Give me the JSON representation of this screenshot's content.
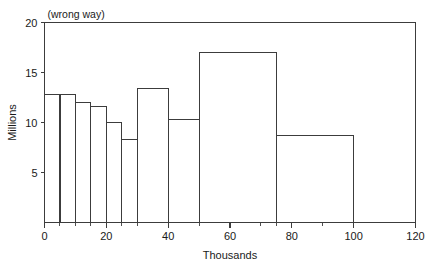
{
  "chart_data": {
    "type": "bar",
    "title": "",
    "annotation": "(wrong way)",
    "xlabel": "Thousands",
    "ylabel": "Millions",
    "xlim": [
      0,
      120
    ],
    "ylim": [
      0,
      20
    ],
    "grid": false,
    "legend": null,
    "x_ticks": [
      0,
      20,
      40,
      60,
      80,
      100,
      120
    ],
    "x_tick_labels": [
      "0",
      "20",
      "40",
      "60",
      "80",
      "100",
      "120"
    ],
    "x_minor_ticks": [
      5,
      10,
      15,
      25,
      30,
      50,
      70,
      75,
      90
    ],
    "y_ticks": [
      5,
      10,
      15,
      20
    ],
    "y_tick_labels": [
      "5",
      "10",
      "15",
      "20"
    ],
    "bins": [
      {
        "x0": 0,
        "x1": 5,
        "value": 12.8
      },
      {
        "x0": 5,
        "x1": 10,
        "value": 12.8
      },
      {
        "x0": 10,
        "x1": 15,
        "value": 12.0
      },
      {
        "x0": 15,
        "x1": 20,
        "value": 11.6
      },
      {
        "x0": 20,
        "x1": 25,
        "value": 10.0
      },
      {
        "x0": 25,
        "x1": 30,
        "value": 8.3
      },
      {
        "x0": 30,
        "x1": 40,
        "value": 13.4
      },
      {
        "x0": 40,
        "x1": 50,
        "value": 10.3
      },
      {
        "x0": 50,
        "x1": 75,
        "value": 17.0
      },
      {
        "x0": 75,
        "x1": 100,
        "value": 8.7
      }
    ],
    "colors": {
      "bar_stroke": "#3c3c3c",
      "bar_fill": "none",
      "axis": "#3c3c3c",
      "text": "#1a1a1a",
      "background": "#ffffff"
    }
  }
}
